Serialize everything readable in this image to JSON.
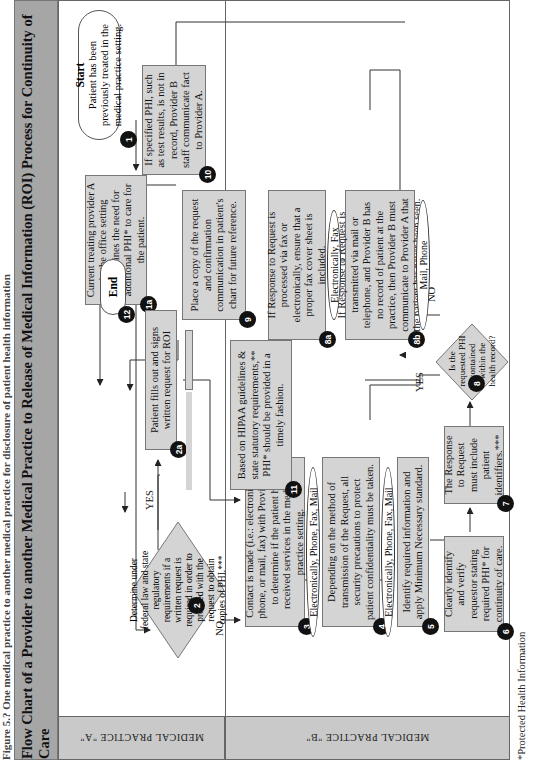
{
  "caption": "Figure 5.? One medical practice to another medical practice for disclosure of patient health information",
  "title": "Flow Chart of a Provider to another Medical Practice to Release of Medical Information (ROI) Process for Continuity of Care",
  "lanes": {
    "a": "MEDICAL PRACTICE \"A\"",
    "b": "MEDICAL PRACTICE \"B\""
  },
  "nodes": {
    "n1": {
      "badge": "1",
      "title": "Start",
      "text": "Patient has been previously treated in the medical practice setting."
    },
    "n1a": {
      "badge": "1a",
      "text": "Current treating provider A in the office setting determines the need for additional PHI* to care for the patient."
    },
    "n2": {
      "badge": "2",
      "text": "Determine under federal law and state regulatory requirements if a written request is required in order to proceed with the request to obtain copies of PHI.***"
    },
    "n2a": {
      "badge": "2a",
      "text": "Patient fills out and signs written request for ROI"
    },
    "n3": {
      "badge": "3",
      "text": "Contact is made (i.e.: electronically, phone, or mail, fax) with Provider B to determine if the patient has received services in the medical practice setting."
    },
    "n4": {
      "badge": "4",
      "text": "Depending on the method of transmission of the Request, all security precautions to protect patient confidentiality must be taken."
    },
    "n5": {
      "badge": "5",
      "text": "Identify required information and apply Minimum Necessary standard."
    },
    "n6": {
      "badge": "6",
      "text": "Clearly identify and verify requestor stating required PHI* for continuity of care."
    },
    "n7": {
      "badge": "7",
      "text": "The Response to Request must include patient identifiers.***"
    },
    "n8": {
      "badge": "8",
      "text": "Is the requested PHI contained within the health record?"
    },
    "n8a": {
      "badge": "8a",
      "text": "If Response to Request is processed via fax or electronically, ensure that a proper fax cover sheet is included."
    },
    "n8b": {
      "badge": "8b",
      "text": "If Response to Request is transmitted via mail or telephone, and Provider B has no record of patient at the practice, then Provider B must communicate to Provider A that the patient has never been seen."
    },
    "n9": {
      "badge": "9",
      "text": "Place a copy of the request and confirmation communication in patient's chart for future reference."
    },
    "n10": {
      "badge": "10",
      "text": "If specified PHI, such as test results, is not in record, Provider B staff communicate fact to Provider A."
    },
    "n11": {
      "badge": "11",
      "text": "Based on HIPAA guidelines & state statutory requirements,** PHI* should be provided in a timely fashion."
    },
    "n12": {
      "badge": "12",
      "text": "End"
    }
  },
  "channels": {
    "c3": "Electronically, Phone, Fax, Mail",
    "c4": "Electronically, Phone, Fax, Mail",
    "c8a": "Electronically, Fax",
    "c8b": "Mail, Phone"
  },
  "edge_labels": {
    "yes_2": "YES",
    "no_2": "NO",
    "yes_8": "YES",
    "no_8": "NO"
  },
  "footnote": "*Protected Health Information"
}
